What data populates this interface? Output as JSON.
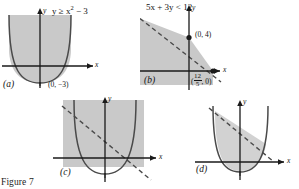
{
  "figure": {
    "caption": "Figure 7",
    "background": "#ffffff",
    "shade_color": "#c9c9c9",
    "curve_color": "#4a4a4a",
    "axis_color": "#1a1a1a"
  },
  "panels": [
    {
      "id": "(a)",
      "label_id": "a",
      "inequality": "y ≥ x² − 3",
      "inequality_lhs": "y ≥ x",
      "inequality_exp": "2",
      "inequality_rhs": "− 3",
      "axis_x": "x",
      "axis_y": "y",
      "points": [
        {
          "text": "(0, −3)"
        }
      ],
      "boundary": "solid",
      "curve_type": "parabola",
      "shaded": "inside-above"
    },
    {
      "id": "(b)",
      "label_id": "b",
      "inequality": "5x + 3y < 12",
      "axis_x": "x",
      "axis_y": "y",
      "points": [
        {
          "text": "(0, 4)"
        },
        {
          "text_prefix": "(",
          "num": "12",
          "den": "5",
          "text_suffix": ", 0)"
        }
      ],
      "boundary": "dashed",
      "curve_type": "line",
      "shaded": "below-left"
    },
    {
      "id": "(c)",
      "label_id": "c",
      "inequality": "",
      "axis_x": "x",
      "axis_y": "y",
      "points": [],
      "boundary": "dashed-line-and-solid-parabola",
      "curve_type": "parabola-and-line",
      "shaded": "union"
    },
    {
      "id": "(d)",
      "label_id": "d",
      "inequality": "",
      "axis_x": "x",
      "axis_y": "y",
      "points": [],
      "boundary": "dashed-line-and-solid-parabola",
      "curve_type": "parabola-and-line",
      "shaded": "intersection"
    }
  ]
}
